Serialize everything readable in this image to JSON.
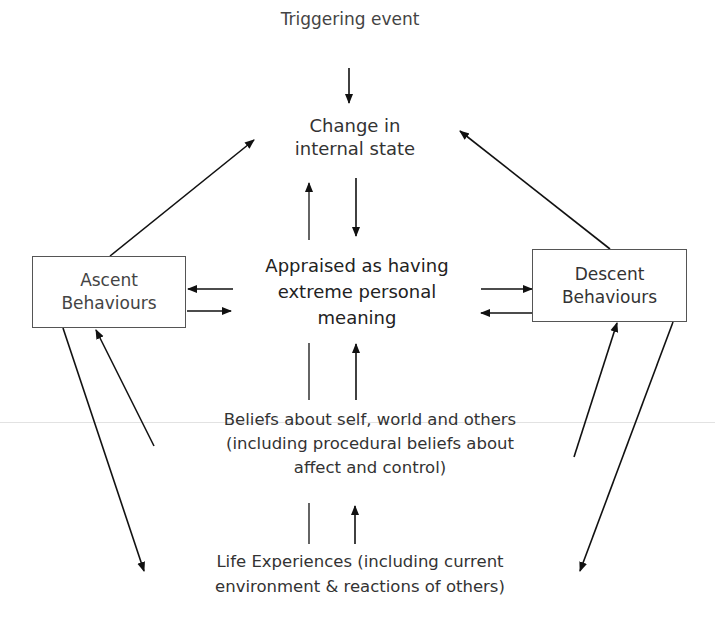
{
  "diagram": {
    "nodes": {
      "trigger": "Triggering event",
      "change_line1": "Change in",
      "change_line2": "internal state",
      "appraised_line1": "Appraised as having",
      "appraised_line2": "extreme personal",
      "appraised_line3": "meaning",
      "ascent_line1": "Ascent",
      "ascent_line2": "Behaviours",
      "descent_line1": "Descent",
      "descent_line2": "Behaviours",
      "beliefs_line1": "Beliefs about self, world and others",
      "beliefs_line2": "(including procedural beliefs about",
      "beliefs_line3": "affect and control)",
      "life_line1": "Life Experiences (including current",
      "life_line2": "environment & reactions of others)"
    },
    "edges": [
      {
        "from": "Triggering event",
        "to": "Change in internal state"
      },
      {
        "from": "Change in internal state",
        "to": "Appraised as having extreme personal meaning"
      },
      {
        "from": "Appraised as having extreme personal meaning",
        "to": "Change in internal state"
      },
      {
        "from": "Ascent Behaviours",
        "to": "Change in internal state"
      },
      {
        "from": "Descent Behaviours",
        "to": "Change in internal state"
      },
      {
        "from": "Appraised as having extreme personal meaning",
        "to": "Ascent Behaviours"
      },
      {
        "from": "Ascent Behaviours",
        "to": "Appraised as having extreme personal meaning"
      },
      {
        "from": "Appraised as having extreme personal meaning",
        "to": "Descent Behaviours"
      },
      {
        "from": "Descent Behaviours",
        "to": "Appraised as having extreme personal meaning"
      },
      {
        "from": "Beliefs about self, world and others",
        "to": "Appraised as having extreme personal meaning"
      },
      {
        "from": "Beliefs about self, world and others",
        "to": "Ascent Behaviours"
      },
      {
        "from": "Beliefs about self, world and others",
        "to": "Descent Behaviours"
      },
      {
        "from": "Ascent Behaviours",
        "to": "Life Experiences"
      },
      {
        "from": "Descent Behaviours",
        "to": "Life Experiences"
      },
      {
        "from": "Life Experiences",
        "to": "Beliefs about self, world and others"
      }
    ]
  }
}
